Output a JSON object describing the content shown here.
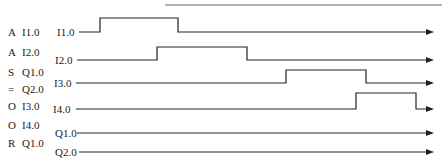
{
  "instructions": [
    {
      "op": "A",
      "operand": "I1.0"
    },
    {
      "op": "A",
      "operand": "I2.0"
    },
    {
      "op": "S",
      "operand": "Q1.0"
    },
    {
      "op": "=",
      "operand": "Q2.0"
    },
    {
      "op": "O",
      "operand": "I3.0"
    },
    {
      "op": "O",
      "operand": "I4.0"
    },
    {
      "op": "R",
      "operand": "Q1.0"
    }
  ],
  "signals": [
    {
      "label": "I1.0",
      "baseline_y": 32,
      "line_start_x": 79,
      "pulses": [
        {
          "rise_x": 100,
          "fall_x": 178,
          "top_y": 18
        }
      ]
    },
    {
      "label": "I2.0",
      "baseline_y": 60,
      "line_start_x": 77,
      "pulses": [
        {
          "rise_x": 157,
          "fall_x": 247,
          "top_y": 47
        }
      ]
    },
    {
      "label": "I3.0",
      "baseline_y": 83,
      "line_start_x": 76,
      "pulses": [
        {
          "rise_x": 286,
          "fall_x": 366,
          "top_y": 70
        }
      ]
    },
    {
      "label": "I4.0",
      "baseline_y": 109,
      "line_start_x": 76,
      "pulses": [
        {
          "rise_x": 356,
          "fall_x": 416,
          "top_y": 93
        }
      ]
    },
    {
      "label": "Q1.0",
      "baseline_y": 133,
      "line_start_x": 77,
      "pulses": []
    },
    {
      "label": "Q2.0",
      "baseline_y": 152,
      "line_start_x": 79,
      "pulses": []
    }
  ],
  "arrow_end_x": 434,
  "top_rule": {
    "x1": 165,
    "x2": 442,
    "y": 5,
    "color": "#9a9a9a"
  },
  "line_color": "#222222"
}
